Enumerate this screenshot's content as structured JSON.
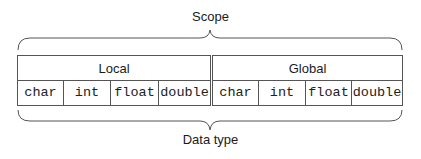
{
  "title_top": "Scope",
  "title_bottom": "Data type",
  "groups": [
    {
      "label": "Local",
      "cells": [
        "char",
        "int",
        "float",
        "double"
      ]
    },
    {
      "label": "Global",
      "cells": [
        "char",
        "int",
        "float",
        "double"
      ]
    }
  ],
  "colors": {
    "line": "#555555",
    "text": "#1a1a1a"
  }
}
